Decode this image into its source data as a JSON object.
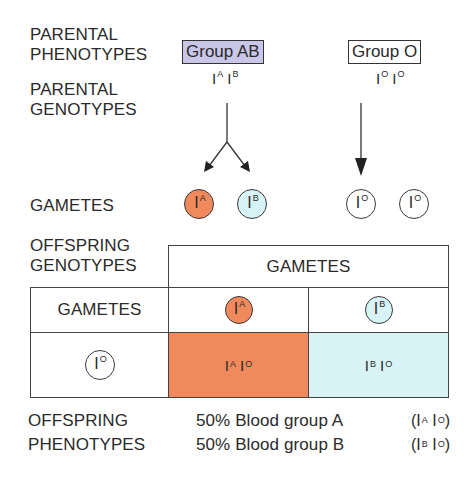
{
  "labels": {
    "parental_phenotypes": [
      "PARENTAL",
      "PHENOTYPES"
    ],
    "parental_genotypes": [
      "PARENTAL",
      "GENOTYPES"
    ],
    "gametes": "GAMETES",
    "offspring_genotypes": [
      "OFFSPRING",
      "GENOTYPES"
    ],
    "offspring_phenotypes": [
      "OFFSPRING",
      "PHENOTYPES"
    ]
  },
  "parents": [
    {
      "phenotype": "Group AB",
      "genotype": [
        {
          "base": "I",
          "sup": "A"
        },
        {
          "base": "I",
          "sup": "B"
        }
      ],
      "box_color": "#c9c6e8"
    },
    {
      "phenotype": "Group O",
      "genotype": [
        {
          "base": "I",
          "sup": "O"
        },
        {
          "base": "I",
          "sup": "O"
        }
      ],
      "box_color": "#ffffff"
    }
  ],
  "gametes": [
    {
      "base": "I",
      "sup": "A",
      "color": "#f08a5c"
    },
    {
      "base": "I",
      "sup": "B",
      "color": "#d8f3f5"
    },
    {
      "base": "I",
      "sup": "O",
      "color": "#ffffff"
    },
    {
      "base": "I",
      "sup": "O",
      "color": "#ffffff"
    }
  ],
  "punnett": {
    "header": "GAMETES",
    "row_header": "GAMETES",
    "columns": [
      {
        "base": "I",
        "sup": "A",
        "color": "#f08a5c"
      },
      {
        "base": "I",
        "sup": "B",
        "color": "#d8f3f5"
      }
    ],
    "rows": [
      {
        "gamete": {
          "base": "I",
          "sup": "O"
        },
        "cells": [
          {
            "g1": {
              "base": "I",
              "sup": "A"
            },
            "g2": {
              "base": "I",
              "sup": "O"
            },
            "color": "#f08a5c"
          },
          {
            "g1": {
              "base": "I",
              "sup": "B"
            },
            "g2": {
              "base": "I",
              "sup": "O"
            },
            "color": "#d8f3f5"
          }
        ]
      }
    ]
  },
  "offspring_phenotypes": [
    {
      "text": "50% Blood group A",
      "genotype": "(I^A I^O)",
      "g1": {
        "base": "I",
        "sup": "A"
      },
      "g2": {
        "base": "I",
        "sup": "O"
      }
    },
    {
      "text": "50% Blood group B",
      "genotype": "(I^B I^O)",
      "g1": {
        "base": "I",
        "sup": "B"
      },
      "g2": {
        "base": "I",
        "sup": "O"
      }
    }
  ]
}
